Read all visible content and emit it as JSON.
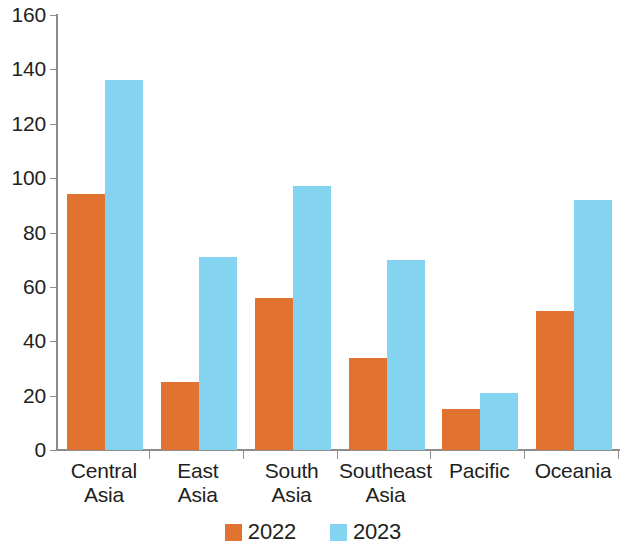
{
  "chart_data": {
    "type": "bar",
    "title": "",
    "subtitle": "",
    "xlabel": "",
    "ylabel": "",
    "categories": [
      "Central Asia",
      "East Asia",
      "South Asia",
      "Southeast Asia",
      "Pacific",
      "Oceania"
    ],
    "category_lines": [
      [
        "Central",
        "Asia"
      ],
      [
        "East",
        "Asia"
      ],
      [
        "South",
        "Asia"
      ],
      [
        "Southeast",
        "Asia"
      ],
      [
        "Pacific"
      ],
      [
        "Oceania"
      ]
    ],
    "series": [
      {
        "name": "2022",
        "color": "#e2722f",
        "values": [
          94,
          25,
          56,
          34,
          15,
          51
        ]
      },
      {
        "name": "2023",
        "color": "#84d3f0",
        "values": [
          136,
          71,
          97,
          70,
          21,
          92
        ]
      }
    ],
    "ylim": [
      0,
      160
    ],
    "ytick_values": [
      0,
      20,
      40,
      60,
      80,
      100,
      120,
      140,
      160
    ],
    "ytick_labels": [
      "0",
      "20",
      "40",
      "60",
      "80",
      "100",
      "120",
      "140",
      "160"
    ],
    "grid": false,
    "legend_position": "bottom",
    "legend_entries": [
      {
        "label": "2022",
        "color": "#e2722f"
      },
      {
        "label": "2023",
        "color": "#84d3f0"
      }
    ],
    "axis_color": "#8c8c8c",
    "text_color": "#231f20",
    "background": "#ffffff"
  }
}
